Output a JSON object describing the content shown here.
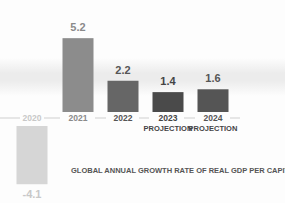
{
  "chart_data": {
    "type": "bar",
    "title": "GLOBAL ANNUAL GROWTH RATE OF REAL GDP PER CAPITA (%)",
    "xlabel": "",
    "ylabel": "",
    "categories": [
      {
        "year": "2020",
        "note": ""
      },
      {
        "year": "2021",
        "note": ""
      },
      {
        "year": "2022",
        "note": ""
      },
      {
        "year": "2023",
        "note": "PROJECTION"
      },
      {
        "year": "2024",
        "note": "PROJECTION"
      }
    ],
    "values": [
      -4.1,
      5.2,
      2.2,
      1.4,
      1.6
    ],
    "value_labels": [
      "-4.1",
      "5.2",
      "2.2",
      "1.4",
      "1.6"
    ],
    "colors": [
      "#d6d6d6",
      "#8c8c8c",
      "#666666",
      "#4a4a4a",
      "#555555"
    ],
    "label_colors": [
      "#c8c8c8",
      "#8a8a8a",
      "#555555",
      "#444444",
      "#555555"
    ],
    "ylim": [
      -4.1,
      5.2
    ],
    "grid": false,
    "legend": "none"
  }
}
